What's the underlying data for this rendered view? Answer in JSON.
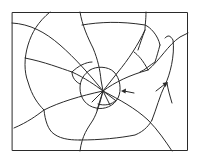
{
  "figure": {
    "frame": {
      "x": 12,
      "y": 12,
      "width": 176,
      "height": 139
    },
    "impact_center": {
      "x": 103,
      "y": 91
    },
    "stroke_color": "#2a2a2a",
    "background_color": "#ffffff",
    "arrows": [
      {
        "name": "arrow-left-pointing-to-ring",
        "from": [
          134,
          93
        ],
        "to": [
          121,
          91
        ]
      },
      {
        "name": "arrow-up-right",
        "from": [
          156,
          91
        ],
        "to": [
          167,
          83
        ]
      }
    ]
  }
}
